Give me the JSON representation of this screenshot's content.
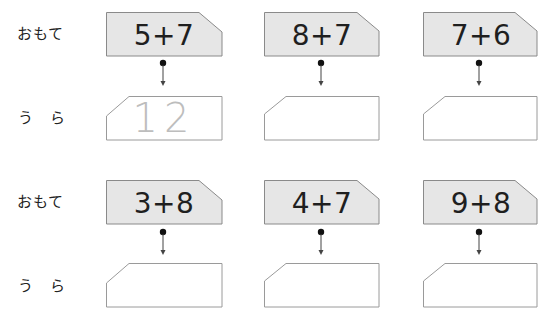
{
  "labels": {
    "front": "おもて",
    "back": "う　ら"
  },
  "colors": {
    "front_fill": "#e6e6e6",
    "front_border": "#8a8a8a",
    "back_fill": "#ffffff",
    "back_border": "#9a9a9a",
    "answer_text": "#bdbdbd"
  },
  "rows": [
    {
      "cards": [
        {
          "front": "5+7",
          "back": "12"
        },
        {
          "front": "8+7",
          "back": ""
        },
        {
          "front": "7+6",
          "back": ""
        }
      ]
    },
    {
      "cards": [
        {
          "front": "3+8",
          "back": ""
        },
        {
          "front": "4+7",
          "back": ""
        },
        {
          "front": "9+8",
          "back": ""
        }
      ]
    }
  ]
}
